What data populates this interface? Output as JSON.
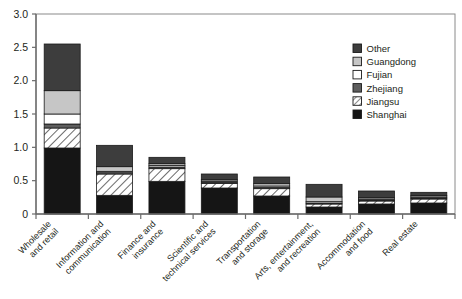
{
  "chart_data": {
    "type": "bar",
    "subtype": "stacked-vertical",
    "title": "",
    "xlabel": "",
    "ylabel": "",
    "ylim": [
      0,
      3.0
    ],
    "yticks": [
      "0",
      "0.5",
      "1.0",
      "1.5",
      "2.0",
      "2.5",
      "3.0"
    ],
    "ytick_values": [
      0,
      0.5,
      1.0,
      1.5,
      2.0,
      2.5,
      3.0
    ],
    "grid": false,
    "legend_position": "top-right",
    "categories": [
      "Wholesale\nand retail",
      "Information and\ncommunication",
      "Finance and\ninsurance",
      "Scientific and\ntechnical services",
      "Transportation\nand storage",
      "Arts, entertainment,\nand recreation",
      "Accommodation\nand food",
      "Real estate"
    ],
    "categories_flat": [
      "Wholesale and retail",
      "Information and communication",
      "Finance and insurance",
      "Scientific and technical services",
      "Transportation and storage",
      "Arts, entertainment, and recreation",
      "Accommodation and food",
      "Real estate"
    ],
    "series": [
      {
        "name": "Shanghai",
        "fill": "solid",
        "color": "#151515",
        "values": [
          0.99,
          0.28,
          0.49,
          0.39,
          0.27,
          0.105,
          0.15,
          0.165
        ]
      },
      {
        "name": "Jiangsu",
        "fill": "hatch-diagonal",
        "color": "#ffffff",
        "values": [
          0.3,
          0.32,
          0.19,
          0.07,
          0.11,
          0.045,
          0.045,
          0.06
        ]
      },
      {
        "name": "Zhejiang",
        "fill": "solid",
        "color": "#5e5e5e",
        "values": [
          0.06,
          0.02,
          0.025,
          0.02,
          0.02,
          0.015,
          0.015,
          0.015
        ]
      },
      {
        "name": "Fujian",
        "fill": "solid",
        "color": "#ffffff",
        "values": [
          0.15,
          0.02,
          0.025,
          0.015,
          0.02,
          0.02,
          0.015,
          0.015
        ]
      },
      {
        "name": "Guangdong",
        "fill": "solid",
        "color": "#c6c6c6",
        "values": [
          0.35,
          0.07,
          0.025,
          0.02,
          0.035,
          0.07,
          0.02,
          0.02
        ]
      },
      {
        "name": "Other",
        "fill": "solid",
        "color": "#3d3d3d",
        "values": [
          0.7,
          0.32,
          0.095,
          0.085,
          0.1,
          0.19,
          0.1,
          0.05
        ]
      }
    ],
    "totals": [
      2.55,
      1.03,
      0.85,
      0.6,
      0.555,
      0.445,
      0.345,
      0.325
    ]
  },
  "legend": {
    "items": [
      {
        "label": "Other"
      },
      {
        "label": "Guangdong"
      },
      {
        "label": "Fujian"
      },
      {
        "label": "Zhejiang"
      },
      {
        "label": "Jiangsu"
      },
      {
        "label": "Shanghai"
      }
    ]
  }
}
